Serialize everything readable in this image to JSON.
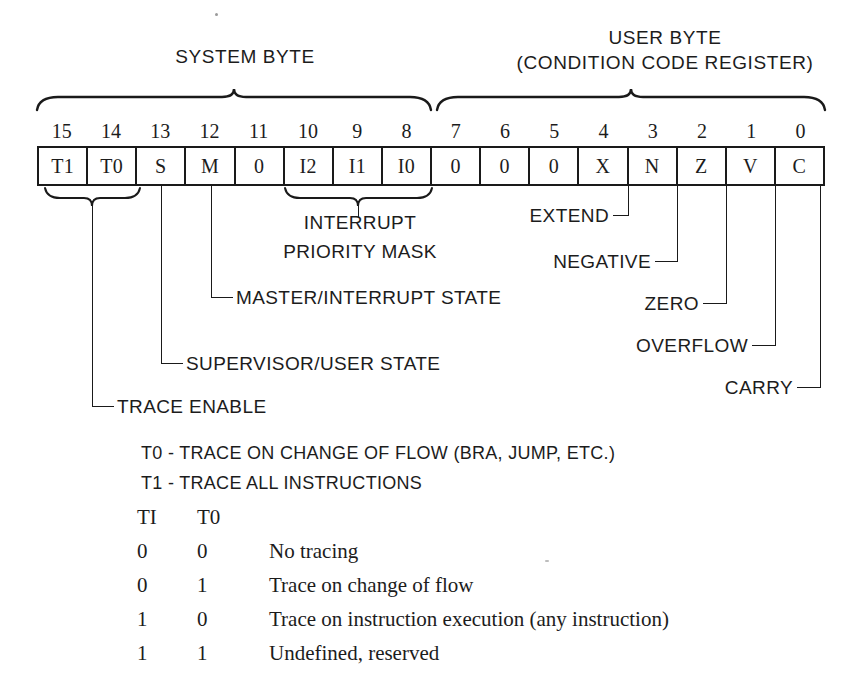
{
  "diagram": {
    "groups": [
      {
        "label": "SYSTEM BYTE"
      },
      {
        "label": "USER BYTE",
        "sublabel": "(CONDITION CODE REGISTER)"
      }
    ],
    "bit_numbers": [
      "15",
      "14",
      "13",
      "12",
      "11",
      "10",
      "9",
      "8",
      "7",
      "6",
      "5",
      "4",
      "3",
      "2",
      "1",
      "0"
    ],
    "bit_cells": [
      "T1",
      "T0",
      "S",
      "M",
      "0",
      "I2",
      "I1",
      "I0",
      "0",
      "0",
      "0",
      "X",
      "N",
      "Z",
      "V",
      "C"
    ],
    "callouts": {
      "interrupt_line1": "INTERRUPT",
      "interrupt_line2": "PRIORITY MASK",
      "master_interrupt_state": "MASTER/INTERRUPT STATE",
      "supervisor_user_state": "SUPERVISOR/USER STATE",
      "trace_enable": "TRACE ENABLE",
      "extend": "EXTEND",
      "negative": "NEGATIVE",
      "zero": "ZERO",
      "overflow": "OVERFLOW",
      "carry": "CARRY"
    },
    "trace_notes": [
      "T0 - TRACE ON CHANGE OF FLOW (BRA, JUMP, ETC.)",
      "T1 - TRACE ALL INSTRUCTIONS"
    ],
    "trace_table": {
      "headers": [
        "TI",
        "T0",
        ""
      ],
      "rows": [
        [
          "0",
          "0",
          "No tracing"
        ],
        [
          "0",
          "1",
          "Trace on change of flow"
        ],
        [
          "1",
          "0",
          "Trace on instruction execution (any instruction)"
        ],
        [
          "1",
          "1",
          "Undefined, reserved"
        ]
      ]
    },
    "colors": {
      "ink": "#1a1a1a",
      "paper": "#ffffff"
    }
  }
}
